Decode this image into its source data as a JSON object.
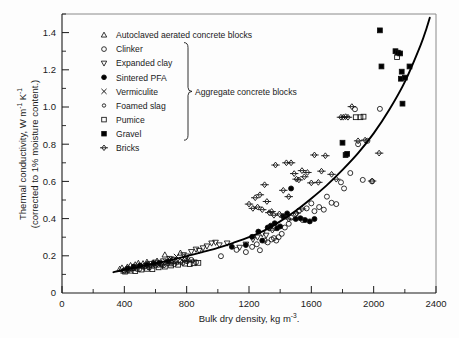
{
  "figure": {
    "background_color": "#fdfdfd",
    "ink_color": "#1a1a1a"
  },
  "chart_data": {
    "type": "scatter",
    "title": "",
    "xlabel_main": "Bulk dry density, kg m",
    "xlabel_exponent": "-3",
    "xlabel_trailing": ".",
    "ylabel_line1_main": "Thermal conductivity, W m",
    "ylabel_line1_exp1": "-1",
    "ylabel_line1_mid": " K",
    "ylabel_line1_exp2": "-1",
    "ylabel_line2": "(corrected to 1% moisture content.)",
    "xlim": [
      0,
      2400
    ],
    "ylim": [
      0,
      1.5
    ],
    "x_major_ticks": [
      0,
      400,
      800,
      1200,
      1600,
      2000,
      2400
    ],
    "x_major_tick_labels": [
      "0",
      "400",
      "800",
      "1200",
      "1600",
      "2000",
      "2400"
    ],
    "x_minor_ticks": [
      200,
      600,
      1000,
      1400,
      1800,
      2200
    ],
    "y_major_ticks": [
      0,
      0.2,
      0.4,
      0.6,
      0.8,
      1.0,
      1.2,
      1.4
    ],
    "y_major_tick_labels": [
      "0",
      "0.2",
      "0.4",
      "0.6",
      "0.8",
      "1.0",
      "1.2",
      "1.4"
    ],
    "y_minor_ticks": [
      0.1,
      0.3,
      0.5,
      0.7,
      0.9,
      1.1,
      1.3,
      1.5
    ],
    "grid": false,
    "legend_position": "upper-left-inside",
    "group_bracket_label": "Aggregate concrete blocks",
    "group_bracket_members": [
      "Clinker",
      "Expanded clay",
      "Sintered PFA",
      "Vermiculite",
      "Foamed slag",
      "Pumice",
      "Gravel"
    ],
    "fit_curve": {
      "name": "fitted trend curve",
      "points": [
        [
          330,
          0.112
        ],
        [
          400,
          0.125
        ],
        [
          500,
          0.142
        ],
        [
          600,
          0.16
        ],
        [
          700,
          0.178
        ],
        [
          800,
          0.198
        ],
        [
          900,
          0.22
        ],
        [
          1000,
          0.243
        ],
        [
          1100,
          0.27
        ],
        [
          1200,
          0.3
        ],
        [
          1300,
          0.337
        ],
        [
          1400,
          0.385
        ],
        [
          1500,
          0.442
        ],
        [
          1600,
          0.508
        ],
        [
          1700,
          0.58
        ],
        [
          1800,
          0.662
        ],
        [
          1900,
          0.752
        ],
        [
          2000,
          0.858
        ],
        [
          2100,
          0.985
        ],
        [
          2200,
          1.135
        ],
        [
          2300,
          1.33
        ],
        [
          2340,
          1.425
        ],
        [
          2360,
          1.48
        ]
      ]
    },
    "series": [
      {
        "name": "Autoclaved aerated concrete blocks",
        "marker": "triangle-up",
        "fill": "open",
        "points": [
          [
            370,
            0.128
          ],
          [
            385,
            0.135
          ],
          [
            395,
            0.118
          ],
          [
            420,
            0.14
          ],
          [
            440,
            0.148
          ],
          [
            455,
            0.132
          ],
          [
            470,
            0.152
          ],
          [
            490,
            0.16
          ],
          [
            505,
            0.145
          ],
          [
            520,
            0.158
          ],
          [
            545,
            0.166
          ],
          [
            560,
            0.15
          ],
          [
            585,
            0.162
          ],
          [
            610,
            0.172
          ],
          [
            640,
            0.158
          ],
          [
            660,
            0.205
          ],
          [
            690,
            0.178
          ],
          [
            705,
            0.168
          ],
          [
            730,
            0.172
          ],
          [
            760,
            0.215
          ],
          [
            790,
            0.186
          ],
          [
            810,
            0.182
          ]
        ]
      },
      {
        "name": "Clinker",
        "marker": "circle",
        "fill": "open",
        "points": [
          [
            400,
            0.122
          ],
          [
            430,
            0.13
          ],
          [
            460,
            0.136
          ],
          [
            495,
            0.128
          ],
          [
            530,
            0.142
          ],
          [
            560,
            0.138
          ],
          [
            600,
            0.148
          ],
          [
            640,
            0.152
          ],
          [
            680,
            0.16
          ],
          [
            720,
            0.155
          ],
          [
            760,
            0.168
          ],
          [
            800,
            0.172
          ],
          [
            830,
            0.178
          ],
          [
            860,
            0.165
          ],
          [
            1020,
            0.198
          ],
          [
            1120,
            0.232
          ],
          [
            1180,
            0.22
          ],
          [
            1220,
            0.248
          ],
          [
            1250,
            0.262
          ],
          [
            1270,
            0.23
          ],
          [
            1300,
            0.282
          ],
          [
            1320,
            0.272
          ],
          [
            1345,
            0.288
          ],
          [
            1360,
            0.295
          ],
          [
            1375,
            0.282
          ],
          [
            1390,
            0.3
          ],
          [
            1410,
            0.318
          ],
          [
            1430,
            0.352
          ],
          [
            1455,
            0.372
          ],
          [
            1470,
            0.405
          ],
          [
            1500,
            0.425
          ],
          [
            1520,
            0.442
          ],
          [
            1545,
            0.392
          ],
          [
            1570,
            0.455
          ],
          [
            1600,
            0.482
          ],
          [
            1620,
            0.44
          ],
          [
            1650,
            0.462
          ],
          [
            1680,
            0.448
          ],
          [
            1700,
            0.518
          ],
          [
            1730,
            0.485
          ],
          [
            1760,
            0.478
          ],
          [
            1790,
            0.595
          ],
          [
            1810,
            0.562
          ],
          [
            1850,
            0.645
          ],
          [
            1880,
            0.988
          ],
          [
            1900,
            0.8
          ],
          [
            1930,
            0.608
          ],
          [
            1960,
            0.818
          ],
          [
            1990,
            0.6
          ],
          [
            2040,
            0.99
          ]
        ]
      },
      {
        "name": "Expanded clay",
        "marker": "triangle-down",
        "fill": "open",
        "points": [
          [
            560,
            0.158
          ],
          [
            600,
            0.165
          ],
          [
            650,
            0.172
          ],
          [
            690,
            0.185
          ],
          [
            720,
            0.18
          ],
          [
            780,
            0.205
          ],
          [
            800,
            0.198
          ],
          [
            830,
            0.222
          ],
          [
            860,
            0.235
          ],
          [
            880,
            0.228
          ],
          [
            905,
            0.242
          ],
          [
            930,
            0.252
          ],
          [
            960,
            0.268
          ],
          [
            985,
            0.272
          ],
          [
            1010,
            0.258
          ],
          [
            1060,
            0.268
          ],
          [
            1140,
            0.245
          ],
          [
            1180,
            0.262
          ],
          [
            1225,
            0.288
          ],
          [
            1255,
            0.3
          ],
          [
            1285,
            0.318
          ],
          [
            1310,
            0.31
          ]
        ]
      },
      {
        "name": "Sintered PFA",
        "marker": "circle",
        "fill": "filled",
        "points": [
          [
            420,
            0.132
          ],
          [
            460,
            0.142
          ],
          [
            500,
            0.148
          ],
          [
            545,
            0.152
          ],
          [
            590,
            0.158
          ],
          [
            625,
            0.162
          ],
          [
            680,
            0.17
          ],
          [
            1090,
            0.248
          ],
          [
            1180,
            0.258
          ],
          [
            1220,
            0.302
          ],
          [
            1260,
            0.33
          ],
          [
            1285,
            0.282
          ],
          [
            1320,
            0.352
          ],
          [
            1340,
            0.362
          ],
          [
            1365,
            0.375
          ],
          [
            1380,
            0.348
          ],
          [
            1400,
            0.358
          ],
          [
            1420,
            0.412
          ],
          [
            1445,
            0.428
          ],
          [
            1470,
            0.562
          ],
          [
            1500,
            0.398
          ],
          [
            1530,
            0.402
          ],
          [
            1560,
            0.392
          ],
          [
            1590,
            0.385
          ],
          [
            1620,
            0.398
          ]
        ]
      },
      {
        "name": "Vermiculite",
        "marker": "cross",
        "fill": "open",
        "points": [
          [
            430,
            0.128
          ],
          [
            470,
            0.14
          ],
          [
            510,
            0.148
          ],
          [
            545,
            0.142
          ],
          [
            590,
            0.158
          ],
          [
            625,
            0.152
          ],
          [
            665,
            0.17
          ],
          [
            700,
            0.182
          ],
          [
            735,
            0.196
          ],
          [
            770,
            0.178
          ]
        ]
      },
      {
        "name": "Foamed slag",
        "marker": "circle-small",
        "fill": "open",
        "points": [
          [
            395,
            0.122
          ],
          [
            425,
            0.118
          ],
          [
            455,
            0.13
          ],
          [
            480,
            0.126
          ],
          [
            520,
            0.138
          ],
          [
            555,
            0.135
          ],
          [
            585,
            0.142
          ],
          [
            620,
            0.148
          ],
          [
            655,
            0.146
          ],
          [
            700,
            0.155
          ],
          [
            740,
            0.162
          ],
          [
            775,
            0.158
          ],
          [
            805,
            0.168
          ],
          [
            840,
            0.172
          ]
        ]
      },
      {
        "name": "Pumice",
        "marker": "square",
        "fill": "open",
        "points": [
          [
            405,
            0.115
          ],
          [
            440,
            0.12
          ],
          [
            470,
            0.118
          ],
          [
            510,
            0.126
          ],
          [
            545,
            0.13
          ],
          [
            580,
            0.128
          ],
          [
            620,
            0.138
          ],
          [
            660,
            0.142
          ],
          [
            700,
            0.148
          ],
          [
            745,
            0.152
          ],
          [
            790,
            0.158
          ],
          [
            820,
            0.155
          ],
          [
            845,
            0.16
          ],
          [
            875,
            0.162
          ],
          [
            1885,
            0.945
          ],
          [
            1915,
            0.945
          ],
          [
            1935,
            0.948
          ],
          [
            2150,
            1.268
          ]
        ]
      },
      {
        "name": "Gravel",
        "marker": "square",
        "fill": "filled",
        "points": [
          [
            1800,
            0.808
          ],
          [
            1820,
            0.742
          ],
          [
            1830,
            0.748
          ],
          [
            2040,
            1.412
          ],
          [
            2050,
            1.218
          ],
          [
            2140,
            1.3
          ],
          [
            2155,
            1.292
          ],
          [
            2170,
            1.288
          ],
          [
            2175,
            1.152
          ],
          [
            2180,
            1.19
          ],
          [
            2185,
            1.018
          ],
          [
            2200,
            1.158
          ],
          [
            2230,
            1.218
          ]
        ]
      },
      {
        "name": "Bricks",
        "marker": "diamond-line",
        "fill": "open",
        "points": [
          [
            1200,
            0.478
          ],
          [
            1225,
            0.455
          ],
          [
            1240,
            0.512
          ],
          [
            1255,
            0.462
          ],
          [
            1270,
            0.528
          ],
          [
            1285,
            0.448
          ],
          [
            1300,
            0.582
          ],
          [
            1315,
            0.492
          ],
          [
            1330,
            0.432
          ],
          [
            1345,
            0.438
          ],
          [
            1360,
            0.418
          ],
          [
            1370,
            0.688
          ],
          [
            1395,
            0.425
          ],
          [
            1420,
            0.552
          ],
          [
            1440,
            0.7
          ],
          [
            1455,
            0.518
          ],
          [
            1470,
            0.7
          ],
          [
            1490,
            0.642
          ],
          [
            1505,
            0.612
          ],
          [
            1520,
            0.608
          ],
          [
            1540,
            0.658
          ],
          [
            1555,
            0.625
          ],
          [
            1575,
            0.648
          ],
          [
            1600,
            0.592
          ],
          [
            1620,
            0.742
          ],
          [
            1645,
            0.595
          ],
          [
            1665,
            0.655
          ],
          [
            1690,
            0.738
          ],
          [
            1730,
            0.638
          ],
          [
            1760,
            0.612
          ],
          [
            1790,
            0.945
          ],
          [
            1805,
            0.945
          ],
          [
            1820,
            0.948
          ],
          [
            1835,
            0.945
          ],
          [
            1860,
            1.002
          ],
          [
            1900,
            0.818
          ],
          [
            1945,
            0.822
          ],
          [
            1990,
            0.602
          ],
          [
            2035,
            0.752
          ],
          [
            1540,
            0.452
          ],
          [
            1505,
            0.43
          ],
          [
            1455,
            0.398
          ],
          [
            1420,
            0.408
          ],
          [
            1350,
            0.338
          ],
          [
            1330,
            0.348
          ]
        ]
      }
    ],
    "legend_entries": [
      {
        "label": "Autoclaved aerated concrete blocks",
        "marker": "triangle-up",
        "fill": "open"
      },
      {
        "label": "Clinker",
        "marker": "circle",
        "fill": "open"
      },
      {
        "label": "Expanded clay",
        "marker": "triangle-down",
        "fill": "open"
      },
      {
        "label": "Sintered  PFA",
        "marker": "circle",
        "fill": "filled"
      },
      {
        "label": "Vermiculite",
        "marker": "cross",
        "fill": "open"
      },
      {
        "label": "Foamed slag",
        "marker": "circle-small",
        "fill": "open"
      },
      {
        "label": "Pumice",
        "marker": "square",
        "fill": "open"
      },
      {
        "label": "Gravel",
        "marker": "square",
        "fill": "filled"
      },
      {
        "label": "Bricks",
        "marker": "diamond-line",
        "fill": "open"
      }
    ]
  }
}
